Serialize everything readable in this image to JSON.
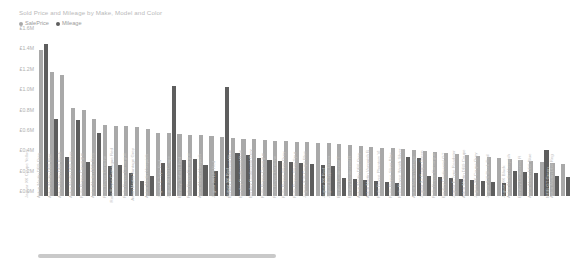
{
  "viz": {
    "title": "Sold Price and Mileage by Make, Model and Color"
  },
  "legend": {
    "position": "top-left",
    "items": [
      {
        "label": "SalePrice",
        "color": "#a9a9a9",
        "icon": "legend-dot-icon"
      },
      {
        "label": "Mileage",
        "color": "#5e5e5e",
        "icon": "legend-dot-icon"
      }
    ]
  },
  "scrollbar": {
    "orientation": "horizontal",
    "thumb_label": "horizontal-scroll-thumb"
  },
  "chart_data": {
    "type": "bar",
    "title": "Sold Price and Mileage by Make, Model and Color",
    "xlabel": "",
    "ylabel": "",
    "ylim": [
      0,
      1600000
    ],
    "grid": false,
    "legend_position": "top-left",
    "ytick_labels": [
      "£1.6M",
      "£1.4M",
      "£1.2M",
      "£1.0M",
      "£0.8M",
      "£0.6M",
      "£0.4M",
      "£0.2M",
      "£0.0M"
    ],
    "ytick_values": [
      1600000,
      1400000,
      1200000,
      1000000,
      800000,
      600000,
      400000,
      200000,
      0
    ],
    "categories": [
      "Jaguar XK Coupe Yellow",
      "Aston Martin DB9 Grey",
      "Aston Martin DB9 Blue",
      "Aston Martin DB9 Black",
      "Aston Martin DB9 Silver",
      "Rolls Royce Camargue",
      "Aston Martin DB5 Grey",
      "Rolls Royce Corniche",
      "Rolls Royce Camargue Red",
      "Rolls Royce Camargue",
      "Aston Martin Vantage Grey",
      "Aston Martin Vanquish",
      "Jaguar E-Type Red",
      "Jaguar XK150 Coupe",
      "Bentley Turbo R Red",
      "Rolls Royce Camargue",
      "Aston Martin Vanquish",
      "Jaguar XK120 Red",
      "Jaguar XK Red",
      "Bentley Continental Blue",
      "Bentley Continental Red",
      "Bentley Continental Grey",
      "Rolls Royce Camargue",
      "Rolls Royce Corniche",
      "Rolls Royce Silver Grey",
      "Rolls Royce Silver Spur",
      "Jaguar XJS Coupe Blue",
      "Jaguar XK Red",
      "Jaguar E-Type Green",
      "Bentley Continental T",
      "Bentley Continental R",
      "Aston Martin DB6 Grey",
      "Aston Martin Vanquish B",
      "Rolls Royce Phantom VI",
      "Rolls Royce Silver Blue",
      "Rolls Royce Wraith Silver",
      "Aston Martin Vantage",
      "Jaguar XJ Coupe Green",
      "Rolls Royce Camargue",
      "Bentley Continental GT",
      "Jaguar E-Type Roadster",
      "Aston Martin DB9 Coupe",
      "Jaguar XK Coupe Grey",
      "Jaguar XJ6 Black Red",
      "Jaguar XK Black",
      "Aston Martin Vanquish",
      "Bentley Continental R",
      "Aston Martin DB9 Blue",
      "MGB GT Green",
      "Aston Martin DB9 Reg"
    ],
    "series": [
      {
        "name": "SalePrice",
        "color": "#a9a9a9",
        "values": [
          1430000,
          1220000,
          1190000,
          860000,
          840000,
          760000,
          700000,
          690000,
          690000,
          680000,
          660000,
          620000,
          620000,
          610000,
          600000,
          600000,
          590000,
          580000,
          570000,
          560000,
          560000,
          550000,
          540000,
          540000,
          530000,
          530000,
          520000,
          520000,
          510000,
          500000,
          490000,
          480000,
          470000,
          470000,
          460000,
          450000,
          440000,
          430000,
          420000,
          410000,
          400000,
          390000,
          380000,
          370000,
          360000,
          350000,
          340000,
          330000,
          320000,
          310000
        ]
      },
      {
        "name": "Mileage",
        "color": "#5e5e5e",
        "values": [
          1490000,
          760000,
          380000,
          750000,
          330000,
          620000,
          290000,
          300000,
          230000,
          150000,
          200000,
          320000,
          1080000,
          350000,
          360000,
          300000,
          250000,
          1070000,
          420000,
          400000,
          370000,
          350000,
          340000,
          330000,
          320000,
          310000,
          300000,
          290000,
          180000,
          170000,
          160000,
          150000,
          140000,
          130000,
          380000,
          370000,
          200000,
          190000,
          180000,
          170000,
          160000,
          150000,
          140000,
          130000,
          250000,
          240000,
          230000,
          450000,
          200000,
          190000
        ]
      }
    ]
  }
}
